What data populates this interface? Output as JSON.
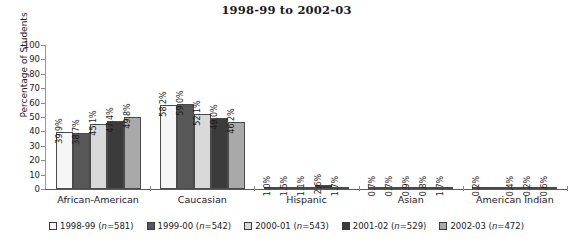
{
  "chart_data": {
    "type": "bar",
    "title": "1998-99 to 2002-03",
    "xlabel": "",
    "ylabel": "Percentage of Students",
    "ylim": [
      0,
      100
    ],
    "ytick_step": 10,
    "yticks": [
      100,
      90,
      80,
      70,
      60,
      50,
      40,
      30,
      20,
      10,
      0
    ],
    "grid": false,
    "legend_position": "bottom",
    "value_suffix": "%",
    "categories": [
      "African-American",
      "Caucasian",
      "Hispanic",
      "Asian",
      "American Indian"
    ],
    "series": [
      {
        "name": "1998-99",
        "n": 581,
        "legend_label": "1998-99 (n=581)",
        "color": "#f6f6f6",
        "values": [
          39.9,
          58.2,
          1.0,
          0.7,
          0.2
        ]
      },
      {
        "name": "1999-00",
        "n": 542,
        "legend_label": "1999-00 (n=542)",
        "color": "#585858",
        "values": [
          38.7,
          59.0,
          1.5,
          0.7,
          null
        ]
      },
      {
        "name": "2000-01",
        "n": 543,
        "legend_label": "2000-01 (n=543)",
        "color": "#d9d9d9",
        "values": [
          45.1,
          52.1,
          1.1,
          0.9,
          0.4
        ]
      },
      {
        "name": "2001-02",
        "n": 529,
        "legend_label": "2001-02 (n=529)",
        "color": "#3b3b3b",
        "values": [
          47.4,
          49.0,
          2.6,
          0.8,
          0.2
        ]
      },
      {
        "name": "2002-03",
        "n": 472,
        "legend_label": "2002-03 (n=472)",
        "color": "#a9a9a9",
        "values": [
          49.8,
          46.2,
          1.7,
          1.7,
          0.6
        ]
      }
    ],
    "value_labels": [
      [
        "39.9%",
        "38.7%",
        "45.1%",
        "47.4%",
        "49.8%"
      ],
      [
        "58.2%",
        "59.0%",
        "52.1%",
        "49.0%",
        "46.2%"
      ],
      [
        "1.0%",
        "1.5%",
        "1.1%",
        "2.6%",
        "1.7%"
      ],
      [
        "0.7%",
        "0.7%",
        "0.9%",
        "0.8%",
        "1.7%"
      ],
      [
        "0.2%",
        "",
        "0.4%",
        "0.2%",
        "0.6%"
      ]
    ]
  }
}
